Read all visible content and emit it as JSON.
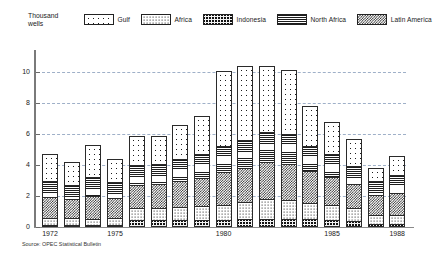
{
  "axis_title": "Thousand\nwells",
  "source_note": "Source: OPEC Statistical Bulletin",
  "legend": {
    "items": [
      {
        "label": "Gulf",
        "pattern": "sparse-dots",
        "key": "gulf"
      },
      {
        "label": "Africa",
        "pattern": "dense-dots",
        "key": "africa"
      },
      {
        "label": "Indonesia",
        "pattern": "dark-grid",
        "key": "indonesia"
      },
      {
        "label": "North Africa",
        "pattern": "horizontal-lines",
        "key": "northafrica"
      },
      {
        "label": "Latin America",
        "pattern": "checkerboard",
        "key": "latinamerica"
      }
    ]
  },
  "chart_data": {
    "type": "bar",
    "stacked": true,
    "title": "",
    "subtitle": "",
    "xlabel": "",
    "ylabel": "Thousand wells",
    "ylim": [
      0,
      11
    ],
    "yticks": [
      0,
      2,
      4,
      6,
      8,
      10
    ],
    "grid": true,
    "legend_position": "top",
    "categories": [
      "1972",
      "1973",
      "1974",
      "1975",
      "1976",
      "1977",
      "1978",
      "1979",
      "1980",
      "1981",
      "1982",
      "1983",
      "1984",
      "1985",
      "1986",
      "1987",
      "1988"
    ],
    "xtick_labels": [
      "1972",
      "1975",
      "1980",
      "1985",
      "1988"
    ],
    "xtick_categories": [
      "1972",
      "1975",
      "1980",
      "1985",
      "1988"
    ],
    "stack_order_bottom_to_top": [
      "Indonesia",
      "Africa",
      "Latin America",
      "North Africa",
      "Gulf"
    ],
    "series": [
      {
        "name": "Indonesia",
        "key": "indonesia",
        "values": [
          0.15,
          0.15,
          0.12,
          0.15,
          0.45,
          0.45,
          0.45,
          0.45,
          0.45,
          0.5,
          0.55,
          0.55,
          0.5,
          0.45,
          0.4,
          0.2,
          0.2
        ]
      },
      {
        "name": "Africa",
        "key": "africa",
        "values": [
          0.45,
          0.45,
          0.4,
          0.45,
          0.75,
          0.8,
          0.85,
          0.9,
          1.0,
          1.15,
          1.25,
          1.2,
          1.05,
          0.95,
          0.85,
          0.55,
          0.55
        ]
      },
      {
        "name": "Latin America",
        "key": "latinamerica",
        "values": [
          1.35,
          1.2,
          1.45,
          1.3,
          1.55,
          1.55,
          1.7,
          1.85,
          2.1,
          2.2,
          2.4,
          2.35,
          2.05,
          1.85,
          1.55,
          1.3,
          1.45
        ]
      },
      {
        "name": "North Africa",
        "key": "northafrica",
        "values": [
          1.05,
          0.95,
          1.25,
          1.0,
          1.25,
          1.25,
          1.4,
          1.5,
          1.7,
          1.8,
          1.95,
          1.9,
          1.65,
          1.45,
          1.15,
          0.95,
          1.15
        ]
      },
      {
        "name": "Gulf",
        "key": "gulf",
        "values": [
          1.7,
          1.45,
          2.08,
          1.5,
          1.9,
          1.85,
          2.2,
          2.5,
          4.85,
          4.75,
          4.25,
          4.15,
          2.55,
          2.1,
          1.75,
          0.85,
          1.25
        ]
      }
    ],
    "totals": [
      4.7,
      4.2,
      5.3,
      4.4,
      5.9,
      5.9,
      6.6,
      7.2,
      10.1,
      10.4,
      10.4,
      10.15,
      7.8,
      6.8,
      5.7,
      3.85,
      4.6
    ]
  },
  "colors": {
    "ink": "#1a1a1a",
    "axis": "#7a7a7a",
    "gridline": "#9fb0c8",
    "bar_outline": "#2a2a2a",
    "indonesia_fill": "#111111"
  }
}
